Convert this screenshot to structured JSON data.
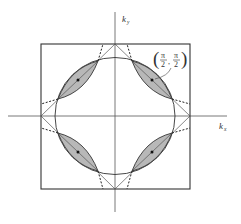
{
  "diagram": {
    "axes": {
      "x_label": "k",
      "x_sub": "x",
      "y_label": "k",
      "y_sub": "y"
    },
    "annotation": {
      "num1": "π",
      "den1": "2",
      "num2": "π",
      "den2": "2",
      "open": "(",
      "close": ")",
      "comma": ","
    },
    "colors": {
      "line": "#3a3a3a",
      "lens_fill": "#b8b8b8",
      "background": "#ffffff"
    },
    "elements": [
      "brillouin-zone-square",
      "diamond",
      "fermi-circle",
      "four-hole-pockets",
      "dashed-extensions"
    ]
  }
}
